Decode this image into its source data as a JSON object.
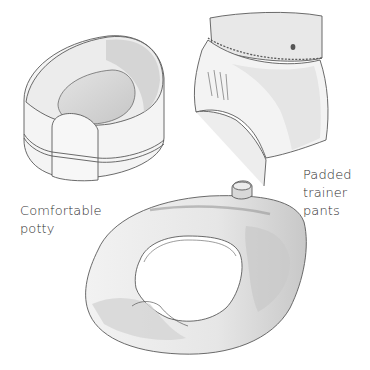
{
  "illustration": {
    "items": [
      {
        "name": "Comfortable potty",
        "label_lines": [
          "Comfortable",
          "potty"
        ]
      },
      {
        "name": "Padded trainer pants",
        "label_lines": [
          "Padded",
          "trainer",
          "pants"
        ]
      },
      {
        "name": "Toilet seat adapter",
        "label_lines": []
      }
    ]
  },
  "colors": {
    "background": "#ffffff",
    "line": "#5a5a5a",
    "shade_dark": "#bdbdbd",
    "shade_mid": "#d6d6d6",
    "shade_light": "#ececec",
    "text": "#2f2f2f"
  }
}
